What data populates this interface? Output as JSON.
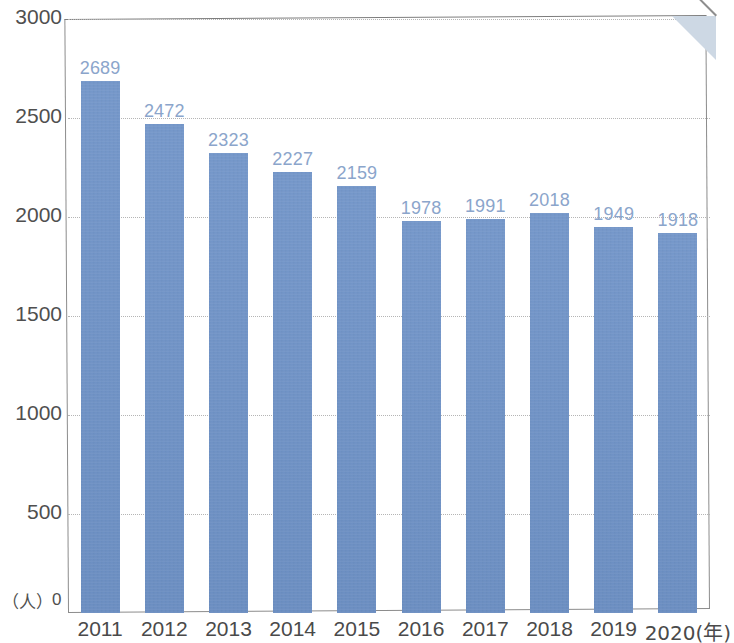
{
  "figure": {
    "unit_label": "（人）",
    "zero_label": "0",
    "fold_icon": "page-fold-corner"
  },
  "chart_data": {
    "type": "bar",
    "title": "",
    "subtitle": "",
    "xlabel": "（年）",
    "ylabel": "（人）",
    "categories": [
      "2011",
      "2012",
      "2013",
      "2014",
      "2015",
      "2016",
      "2017",
      "2018",
      "2019",
      "2020"
    ],
    "x_tick_labels": [
      "2011",
      "2012",
      "2013",
      "2014",
      "2015",
      "2016",
      "2017",
      "2018",
      "2019",
      "2020(年)"
    ],
    "values": [
      2689,
      2472,
      2323,
      2227,
      2159,
      1978,
      1991,
      2018,
      1949,
      1918
    ],
    "data_labels": [
      "2689",
      "2472",
      "2323",
      "2227",
      "2159",
      "1978",
      "1991",
      "2018",
      "1949",
      "1918"
    ],
    "ylim": [
      0,
      3000
    ],
    "y_ticks": [
      0,
      500,
      1000,
      1500,
      2000,
      2500,
      3000
    ],
    "y_tick_labels": [
      "0",
      "500",
      "1000",
      "1500",
      "2000",
      "2500",
      "3000"
    ],
    "grid": true,
    "grid_style": "dotted",
    "legend": null,
    "series": [
      {
        "name": "人数",
        "values": [
          2689,
          2472,
          2323,
          2227,
          2159,
          1978,
          1991,
          2018,
          1949,
          1918
        ]
      }
    ],
    "colors": {
      "bar": "#6f93c8",
      "data_label": "#8ba5cb",
      "axis_text": "#4a4a4a",
      "gridline": "#b5b5b5",
      "frame": "#8c8c8c",
      "background": "#ffffff",
      "fold": "#cdd8e4"
    }
  }
}
